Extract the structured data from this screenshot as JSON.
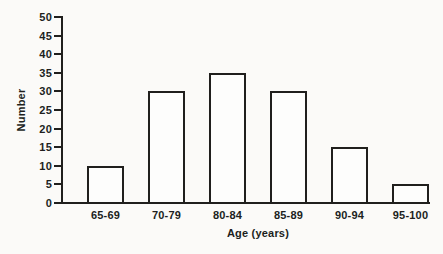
{
  "figure": {
    "background_color": "#fbfaf8",
    "line_color": "#201f1d",
    "text_color": "#201f1d",
    "bar_fill_color": "#fdfdfc"
  },
  "chart_data": {
    "type": "bar",
    "title": "",
    "categories": [
      "65-69",
      "70-79",
      "80-84",
      "85-89",
      "90-94",
      "95-100"
    ],
    "values": [
      10,
      30,
      35,
      30,
      15,
      5
    ],
    "xlabel": "Age (years)",
    "ylabel": "Number",
    "ylim": [
      0,
      50
    ],
    "yticks": [
      0,
      5,
      10,
      15,
      20,
      25,
      30,
      35,
      40,
      45,
      50
    ],
    "grid": false,
    "legend": false
  }
}
